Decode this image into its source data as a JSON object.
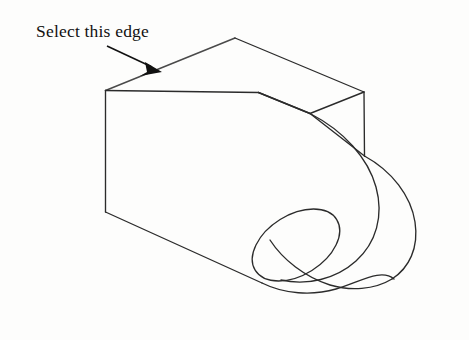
{
  "canvas": {
    "width": 469,
    "height": 340,
    "background_color": "#fdfdfc",
    "line_color": "#2b2b2b",
    "highlight_edge_color": "#4a4a4a",
    "annotation_color": "#111111"
  },
  "annotation": {
    "label": "Select this edge",
    "leader_icon": "arrow-icon",
    "leader_start": "108,47",
    "leader_end": "160,71",
    "points_to": "top-front-left-edge"
  },
  "part": {
    "name": "isometric-bracket-link",
    "description": "Isometric line drawing of a machined bracket: rectangular block with a rectangular notch at the upper right and a rounded cylindrical boss containing a through hole.",
    "features": [
      "top-face",
      "front-left-face",
      "front-right-face",
      "notch",
      "cylindrical-boss",
      "through-hole"
    ]
  },
  "geometry": {
    "top_face": "105,90 235,38 363,92 312,113 363,92 363,155",
    "top_face_outline": "105,90 235,38 364,92 311,114 258,92 311,70",
    "front_left_face": "105,90 105,212 258,283 258,160",
    "notch_vertical_edge": "364,92 364,156",
    "highlight_edge": "105,90 235,38",
    "boss_outer_curve": "364,156 C 419,186 430,232 414,262 C 398,292 352,304 308,296",
    "bottom_edge": "105,212 258,283",
    "hole_ellipse": {
      "cx": 296,
      "cy": 245,
      "rx": 48,
      "ry": 30,
      "rotation": -32
    },
    "boss_outer_ellipse": {
      "cx": 318,
      "cy": 232,
      "rx": 84,
      "ry": 54,
      "rotation": -32
    }
  }
}
